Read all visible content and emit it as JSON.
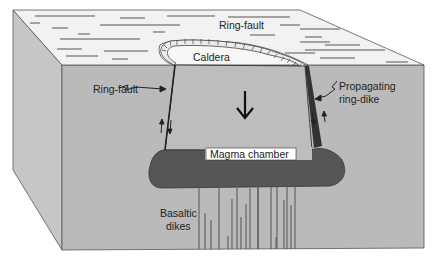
{
  "diagram": {
    "labels": {
      "ring_fault_top": "Ring-fault",
      "caldera": "Caldera",
      "ring_fault_left": "Ring-fault",
      "propagating_line1": "Propagating",
      "propagating_line2": "ring-dike",
      "magma_chamber": "Magma chamber",
      "basaltic_line1": "Basaltic",
      "basaltic_line2": "dikes"
    },
    "colors": {
      "top_surface": "#f1f1f1",
      "front_face": "#b9b9b9",
      "side_face": "#c4c4c4",
      "piston": "#bdbdbd",
      "magma": "#555555",
      "outline": "#444444",
      "text": "#222222"
    },
    "icons": {
      "subsidence_arrow": "down-arrow",
      "fault_motion_arrows": "up-down-arrows",
      "leader_squiggle": "zigzag-leader"
    }
  }
}
